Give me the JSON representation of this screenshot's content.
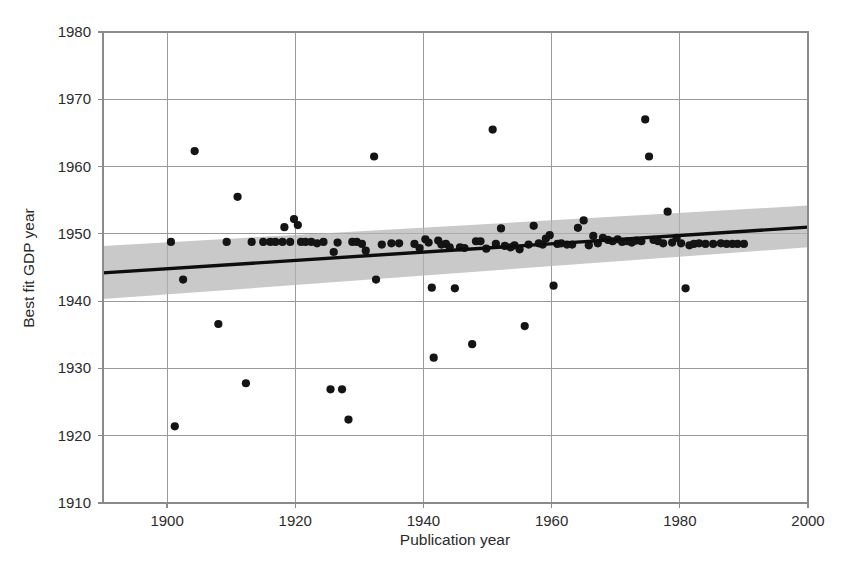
{
  "chart_data": {
    "type": "scatter",
    "title": "",
    "xlabel": "Publication year",
    "ylabel": "Best fit GDP year",
    "xlim": [
      1890,
      2000
    ],
    "ylim": [
      1910,
      1980
    ],
    "xticks": [
      1900,
      1920,
      1940,
      1960,
      1980,
      2000
    ],
    "yticks": [
      1910,
      1920,
      1930,
      1940,
      1950,
      1960,
      1970,
      1980
    ],
    "xtick_labels": [
      "1900",
      "1920",
      "1940",
      "1960",
      "1980",
      "2000"
    ],
    "ytick_labels": [
      "1910",
      "1920",
      "1930",
      "1940",
      "1950",
      "1960",
      "1970",
      "1980"
    ],
    "grid": true,
    "legend": null,
    "series": [
      {
        "name": "Studies",
        "marker": "filled-circle",
        "color": "#141414",
        "points": [
          [
            1900.6,
            1948.8
          ],
          [
            1901.2,
            1921.4
          ],
          [
            1902.5,
            1943.2
          ],
          [
            1904.3,
            1962.3
          ],
          [
            1908.0,
            1936.6
          ],
          [
            1909.3,
            1948.8
          ],
          [
            1911.0,
            1955.5
          ],
          [
            1912.3,
            1927.8
          ],
          [
            1913.2,
            1948.8
          ],
          [
            1915.0,
            1948.8
          ],
          [
            1916.1,
            1948.8
          ],
          [
            1916.9,
            1948.8
          ],
          [
            1918.0,
            1948.8
          ],
          [
            1918.3,
            1951.0
          ],
          [
            1919.2,
            1948.8
          ],
          [
            1919.8,
            1952.2
          ],
          [
            1920.4,
            1951.3
          ],
          [
            1920.9,
            1948.8
          ],
          [
            1921.6,
            1948.8
          ],
          [
            1922.5,
            1948.8
          ],
          [
            1923.4,
            1948.6
          ],
          [
            1924.4,
            1948.8
          ],
          [
            1925.5,
            1926.9
          ],
          [
            1926.0,
            1947.3
          ],
          [
            1926.6,
            1948.7
          ],
          [
            1927.3,
            1926.9
          ],
          [
            1928.3,
            1922.4
          ],
          [
            1928.9,
            1948.8
          ],
          [
            1929.6,
            1948.8
          ],
          [
            1930.4,
            1948.5
          ],
          [
            1931.0,
            1947.5
          ],
          [
            1932.3,
            1961.5
          ],
          [
            1932.6,
            1943.2
          ],
          [
            1933.5,
            1948.4
          ],
          [
            1935.0,
            1948.6
          ],
          [
            1936.2,
            1948.6
          ],
          [
            1938.6,
            1948.5
          ],
          [
            1939.4,
            1947.9
          ],
          [
            1940.3,
            1949.2
          ],
          [
            1940.8,
            1948.7
          ],
          [
            1941.3,
            1942.0
          ],
          [
            1941.6,
            1931.6
          ],
          [
            1942.3,
            1949.0
          ],
          [
            1942.8,
            1948.4
          ],
          [
            1943.5,
            1948.5
          ],
          [
            1944.1,
            1948.0
          ],
          [
            1944.9,
            1941.9
          ],
          [
            1945.7,
            1948.0
          ],
          [
            1946.4,
            1947.9
          ],
          [
            1947.6,
            1933.6
          ],
          [
            1948.2,
            1948.9
          ],
          [
            1948.9,
            1948.9
          ],
          [
            1949.8,
            1947.8
          ],
          [
            1950.8,
            1965.5
          ],
          [
            1951.3,
            1948.5
          ],
          [
            1952.1,
            1950.8
          ],
          [
            1952.7,
            1948.2
          ],
          [
            1953.6,
            1948.0
          ],
          [
            1954.2,
            1948.3
          ],
          [
            1955.0,
            1947.7
          ],
          [
            1955.8,
            1936.3
          ],
          [
            1956.4,
            1948.4
          ],
          [
            1957.2,
            1951.2
          ],
          [
            1958.0,
            1948.6
          ],
          [
            1958.6,
            1948.4
          ],
          [
            1959.1,
            1949.3
          ],
          [
            1959.7,
            1949.8
          ],
          [
            1960.3,
            1942.3
          ],
          [
            1960.9,
            1948.5
          ],
          [
            1961.5,
            1948.6
          ],
          [
            1962.4,
            1948.4
          ],
          [
            1963.2,
            1948.4
          ],
          [
            1964.1,
            1950.9
          ],
          [
            1965.0,
            1952.0
          ],
          [
            1965.8,
            1948.3
          ],
          [
            1966.5,
            1949.7
          ],
          [
            1967.2,
            1948.6
          ],
          [
            1968.0,
            1949.4
          ],
          [
            1968.8,
            1949.1
          ],
          [
            1969.5,
            1948.9
          ],
          [
            1970.3,
            1949.2
          ],
          [
            1971.0,
            1948.8
          ],
          [
            1971.8,
            1948.9
          ],
          [
            1972.5,
            1948.7
          ],
          [
            1973.2,
            1949.0
          ],
          [
            1974.0,
            1948.9
          ],
          [
            1974.6,
            1967.0
          ],
          [
            1975.2,
            1961.5
          ],
          [
            1975.9,
            1949.1
          ],
          [
            1976.6,
            1948.9
          ],
          [
            1977.4,
            1948.6
          ],
          [
            1978.1,
            1953.3
          ],
          [
            1978.8,
            1948.7
          ],
          [
            1979.5,
            1949.4
          ],
          [
            1980.2,
            1948.6
          ],
          [
            1980.9,
            1941.9
          ],
          [
            1981.5,
            1948.3
          ],
          [
            1982.2,
            1948.5
          ],
          [
            1983.0,
            1948.6
          ],
          [
            1984.0,
            1948.5
          ],
          [
            1985.2,
            1948.5
          ],
          [
            1986.4,
            1948.6
          ],
          [
            1987.3,
            1948.5
          ],
          [
            1988.2,
            1948.5
          ],
          [
            1989.0,
            1948.5
          ],
          [
            1990.0,
            1948.5
          ]
        ]
      }
    ],
    "fit_line": {
      "name": "Linear best fit",
      "color": "#0d0d0d",
      "x_start": 1890,
      "y_start": 1944.2,
      "x_end": 2000,
      "y_end": 1951.0
    },
    "confidence_band": {
      "name": "Confidence interval",
      "color": "#b4b4b4",
      "x_start": 1890,
      "lower_start": 1940.3,
      "upper_start": 1948.2,
      "x_end": 2000,
      "lower_end": 1948.0,
      "upper_end": 1954.2
    }
  }
}
